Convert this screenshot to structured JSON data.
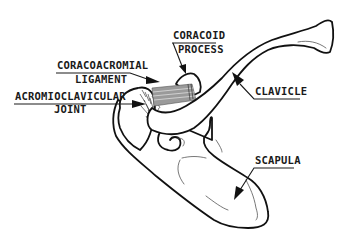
{
  "diagram": {
    "labels": {
      "coracoid_process": {
        "line1": "CORACOID",
        "line2": "PROCESS"
      },
      "coracoacromial_ligament": {
        "line1": "CORACOACROMIAL",
        "line2": "LIGAMENT"
      },
      "acromioclavicular_joint": {
        "line1": "ACROMIOCLAVICULAR",
        "line2": "JOINT"
      },
      "clavicle": {
        "line1": "CLAVICLE"
      },
      "scapula": {
        "line1": "SCAPULA"
      }
    },
    "structures": [
      "clavicle",
      "scapula",
      "acromion",
      "coracoid process",
      "coracoacromial ligament",
      "acromioclavicular joint"
    ],
    "colors": {
      "background": "#ffffff",
      "ink": "#111111",
      "ligament_fill": "#9a9a9a"
    }
  }
}
